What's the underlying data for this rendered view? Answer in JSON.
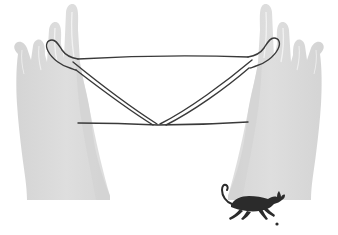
{
  "canvas": {
    "width": 338,
    "height": 235,
    "background_color": "#ffffff",
    "title": "Cat's Cradle String Figure Between Two Hands"
  },
  "palette": {
    "hand_fill": "#dcdcdc",
    "hand_shadow": "#d2d2d2",
    "hand_highlight": "#e8e8e8",
    "finger_line": "#f4f4f4",
    "string_color": "#3a3a3a",
    "cat_color": "#2b2b2b",
    "background": "#ffffff"
  },
  "figure": {
    "name": "cats-cradle",
    "string_width": 1.4
  },
  "hands": [
    {
      "id": "left-hand",
      "label": "Left Hand",
      "side": "left",
      "fill": "#dcdcdc",
      "fingers": 4,
      "string_anchor_x": 62,
      "string_anchor_y": 48
    },
    {
      "id": "right-hand",
      "label": "Right Hand",
      "side": "right",
      "fill": "#dcdcdc",
      "fingers": 4,
      "string_anchor_x": 262,
      "string_anchor_y": 48
    }
  ],
  "strings": {
    "label": "Looped String",
    "color": "#3a3a3a",
    "segments": [
      {
        "id": "top-rail",
        "label": "Top Horizontal String",
        "from": [
          78,
          59
        ],
        "to": [
          248,
          57
        ]
      },
      {
        "id": "bottom-rail",
        "label": "Bottom Horizontal String",
        "from": [
          78,
          123
        ],
        "to": [
          248,
          122
        ]
      },
      {
        "id": "diag-left-upper",
        "label": "Left Upper Diagonal",
        "from": [
          74,
          63
        ],
        "to": [
          157,
          124
        ]
      },
      {
        "id": "diag-left-lower",
        "label": "Left Lower Diagonal",
        "from": [
          76,
          69
        ],
        "to": [
          152,
          125
        ]
      },
      {
        "id": "diag-right-upper",
        "label": "Right Upper Diagonal",
        "from": [
          252,
          61
        ],
        "to": [
          160,
          124
        ]
      },
      {
        "id": "diag-right-lower",
        "label": "Right Lower Diagonal",
        "from": [
          250,
          67
        ],
        "to": [
          165,
          125
        ]
      }
    ],
    "crossing_point": [
      158,
      124
    ]
  },
  "cat": {
    "id": "running-cat",
    "label": "Running Cat Silhouette",
    "color": "#2b2b2b",
    "pose": "leaping",
    "position": [
      220,
      186
    ],
    "width": 62,
    "height": 44,
    "speck_dot": [
      277,
      224
    ]
  }
}
